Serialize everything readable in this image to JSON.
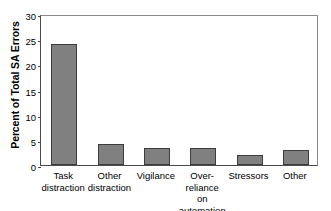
{
  "chart_data": {
    "type": "bar",
    "title": "",
    "subtitle": "",
    "xlabel": "",
    "ylabel": "Percent of Total SA Errors",
    "ylim": [
      0,
      30
    ],
    "yticks": [
      0,
      5,
      10,
      15,
      20,
      25,
      30
    ],
    "ytick_labels": [
      "0",
      "5",
      "10",
      "15",
      "20",
      "25",
      "30"
    ],
    "grid": false,
    "legend": null,
    "categories": [
      "Task\ndistraction",
      "Other\ndistraction",
      "Vigilance",
      "Over-reliance\non automation",
      "Stressors",
      "Other"
    ],
    "values": [
      24.1,
      4.1,
      3.4,
      3.4,
      2.0,
      3.0
    ],
    "series": [
      {
        "name": "Percent of Total SA Errors",
        "values": [
          24.1,
          4.1,
          3.4,
          3.4,
          2.0,
          3.0
        ]
      }
    ],
    "bar_color": "#808080",
    "bar_edge_color": "#3d3d3d",
    "axis_color": "#4a4a4a",
    "background_color": "#ffffff"
  }
}
